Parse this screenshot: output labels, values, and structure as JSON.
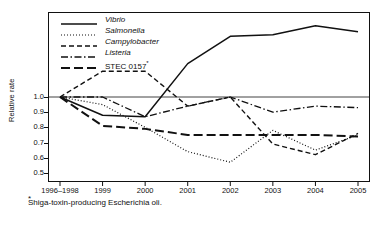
{
  "chart_data": {
    "type": "line",
    "title": "",
    "xlabel": "",
    "ylabel": "Relative rate",
    "categories": [
      "1996–1998",
      "1999",
      "2000",
      "2001",
      "2002",
      "2003",
      "2004",
      "2005"
    ],
    "yticks": [
      0.5,
      0.6,
      0.7,
      0.8,
      0.9,
      1.0
    ],
    "ylim": [
      0.44,
      1.56
    ],
    "grid": false,
    "reference_line": 1.0,
    "legend_position": "top-left",
    "series": [
      {
        "name": "Vibrio",
        "style": "solid",
        "values": [
          1.0,
          0.88,
          0.87,
          1.22,
          1.4,
          1.41,
          1.47,
          1.43
        ]
      },
      {
        "name": "Salmonella",
        "style": "dotted",
        "values": [
          1.0,
          0.95,
          0.8,
          0.64,
          0.57,
          0.78,
          0.65,
          0.75
        ]
      },
      {
        "name": "Campylobacter",
        "style": "dashed",
        "values": [
          1.0,
          1.17,
          1.17,
          0.94,
          1.0,
          0.69,
          0.62,
          0.76
        ]
      },
      {
        "name": "Listeria",
        "style": "dashdot",
        "values": [
          1.0,
          1.0,
          0.87,
          0.94,
          1.0,
          0.9,
          0.94,
          0.93
        ]
      },
      {
        "name": "STEC 0157",
        "style": "longdash",
        "values": [
          1.0,
          0.81,
          0.79,
          0.75,
          0.75,
          0.75,
          0.75,
          0.74
        ]
      }
    ]
  },
  "legend": {
    "items": [
      {
        "label": "Vibrio",
        "style": "solid",
        "italic": true
      },
      {
        "label": "Salmonella",
        "style": "dotted",
        "italic": true
      },
      {
        "label": "Campylobacter",
        "style": "dashed",
        "italic": true
      },
      {
        "label": "Listeria",
        "style": "dashdot",
        "italic": true
      },
      {
        "label": "STEC 0157",
        "style": "longdash",
        "italic": false
      }
    ]
  },
  "footnote": {
    "marker": "*",
    "text": "Shiga-toxin-producing Escherichia oli."
  },
  "colors": {
    "ink": "#111111",
    "background": "#ffffff"
  }
}
